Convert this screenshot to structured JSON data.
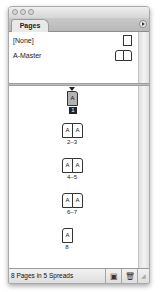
{
  "panel": {
    "tab_label": "Pages",
    "menu_icon": "panel-menu-icon"
  },
  "masters": [
    {
      "label": "[None]",
      "thumbnail": "single-page"
    },
    {
      "label": "A-Master",
      "thumbnail": "spread"
    }
  ],
  "pages": [
    {
      "label": "1",
      "pages": [
        "A"
      ],
      "selected": true
    },
    {
      "label": "2–3",
      "pages": [
        "A",
        "A"
      ]
    },
    {
      "label": "4–5",
      "pages": [
        "A",
        "A"
      ]
    },
    {
      "label": "6–7",
      "pages": [
        "A",
        "A"
      ]
    },
    {
      "label": "8",
      "pages": [
        "A"
      ]
    }
  ],
  "status": {
    "text": "8 Pages in 5 Spreads",
    "new_page_icon": "new-page-icon",
    "delete_icon": "trash-icon"
  }
}
